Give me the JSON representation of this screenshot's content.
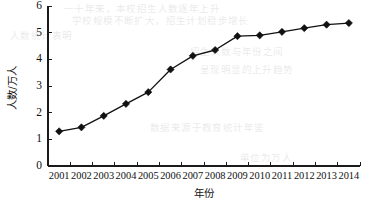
{
  "chart_data": {
    "type": "line",
    "title": "",
    "xlabel": "年份",
    "ylabel": "人数/万人",
    "categories": [
      "2001",
      "2002",
      "2003",
      "2004",
      "2005",
      "2006",
      "2007",
      "2008",
      "2009",
      "2010",
      "2011",
      "2012",
      "2013",
      "2014"
    ],
    "values": [
      1.3,
      1.45,
      1.88,
      2.33,
      2.77,
      3.62,
      4.13,
      4.35,
      4.87,
      4.9,
      5.03,
      5.17,
      5.3,
      5.36
    ],
    "series": [
      {
        "name": "人数/万人",
        "values": [
          1.3,
          1.45,
          1.88,
          2.33,
          2.77,
          3.62,
          4.13,
          4.35,
          4.87,
          4.9,
          5.03,
          5.17,
          5.3,
          5.36
        ]
      }
    ],
    "ylim": [
      0,
      6
    ],
    "ytick_labels": [
      "0",
      "1",
      "2",
      "3",
      "4",
      "5",
      "6"
    ],
    "ytick_values": [
      0,
      1,
      2,
      3,
      4,
      5,
      6
    ],
    "xtick_labels": [
      "2001",
      "2002",
      "2003",
      "2004",
      "2005",
      "2006",
      "2007",
      "2008",
      "2009",
      "2010",
      "2011",
      "2012",
      "2013",
      "2014"
    ],
    "grid": false,
    "legend": false,
    "legend_position": "none",
    "marker": "diamond",
    "line_color": "#111111",
    "marker_color": "#111111",
    "axis_color": "#1a1a1a",
    "background_color": "#ffffff"
  },
  "axes": {
    "y_title": "人数/万人",
    "x_title": "年份"
  },
  "background_bleed": {
    "line1": "一十年来，本校招生人数逐年上升",
    "line2": "学校规模不断扩大，招生计划稳步增长",
    "line3": "人数统计表明",
    "line4": "招生人数与年份之间",
    "line5": "呈现明显的上升趋势",
    "line6": "数据来源于教育统计年鉴",
    "line7": "单位为万人"
  }
}
